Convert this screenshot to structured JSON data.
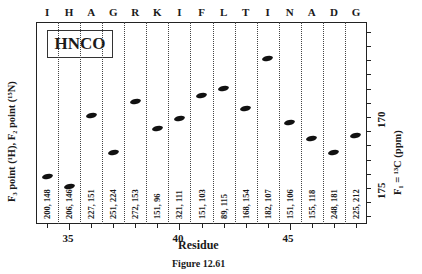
{
  "chart_data": {
    "type": "scatter",
    "title": "HNCO",
    "caption": "Figure 12.61",
    "xlabel": "Residue",
    "ylabel_left": "F3 point (1H), F2 point (15N)",
    "ylabel_right": "F1 = 13C (ppm)",
    "x_ticks": [
      35,
      40,
      45
    ],
    "y_ticks": [
      170,
      175
    ],
    "ylim": [
      163.3,
      177.5
    ],
    "y_inverted": true,
    "residues": [
      34,
      35,
      36,
      37,
      38,
      39,
      40,
      41,
      42,
      43,
      44,
      45,
      46,
      47,
      48
    ],
    "residue_letters": [
      "I",
      "H",
      "A",
      "G",
      "R",
      "K",
      "I",
      "F",
      "L",
      "T",
      "I",
      "N",
      "A",
      "D",
      "G"
    ],
    "strip_labels": [
      "200, 148",
      "206, 146",
      "227, 151",
      "251, 224",
      "272, 153",
      "151, 96",
      "321, 111",
      "151, 103",
      "89, 115",
      "168, 154",
      "182, 107",
      "151, 106",
      "155, 118",
      "248, 181",
      "225, 212"
    ],
    "c13_ppm": [
      174.2,
      174.9,
      169.9,
      172.5,
      168.9,
      170.8,
      170.1,
      168.5,
      168.0,
      169.4,
      165.9,
      170.4,
      171.5,
      172.5,
      171.3
    ]
  },
  "labels": {
    "box": "HNCO",
    "xlabel": "Residue",
    "caption": "Figure 12.61",
    "ylabel_left": "F₃ point (¹H),  F₂ point (¹⁵N)",
    "ylabel_right": "F₁ = ¹³C (ppm)",
    "xtick_35": "35",
    "xtick_40": "40",
    "xtick_45": "45",
    "ytick_170": "170",
    "ytick_175": "175"
  }
}
